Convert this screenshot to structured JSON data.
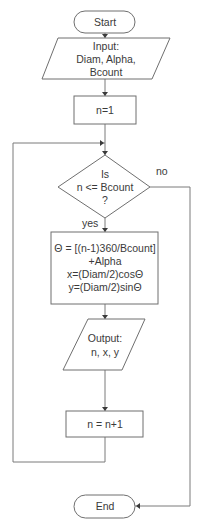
{
  "flowchart": {
    "start": {
      "label": "Start"
    },
    "input": {
      "lines": [
        "Input:",
        "Diam, Alpha,",
        "Bcount"
      ]
    },
    "init": {
      "label": "n=1"
    },
    "decision": {
      "lines": [
        "Is",
        "n <= Bcount",
        "?"
      ],
      "yes_label": "yes",
      "no_label": "no"
    },
    "process": {
      "lines": [
        "Θ = [(n-1)360/Bcount]",
        "+Alpha",
        "x=(Diam/2)cosΘ",
        "y=(Diam/2)sinΘ"
      ]
    },
    "output": {
      "lines": [
        "Output:",
        "n, x, y"
      ]
    },
    "increment": {
      "label": "n = n+1"
    },
    "end": {
      "label": "End"
    }
  }
}
